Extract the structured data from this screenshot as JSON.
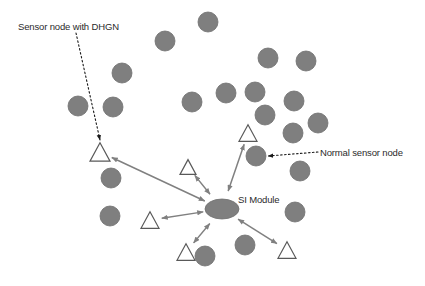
{
  "figure": {
    "width": 425,
    "height": 286,
    "background_color": "#ffffff",
    "node_fill_color": "#7f7f7f",
    "node_stroke_color": "#6e6e6e",
    "triangle_fill_color": "#ffffff",
    "triangle_stroke_color": "#595959",
    "connector_color": "#808080",
    "callout_color": "#1a1a1a",
    "text_color": "#2b2b2b"
  },
  "labels": {
    "sensor_with_dhgn": "Sensor node with DHGN",
    "normal_sensor_node": "Normal sensor node",
    "si_module": "SI Module"
  },
  "hub": {
    "name": "si-module",
    "shape": "ellipse",
    "cx": 222,
    "cy": 209,
    "rx": 17,
    "ry": 10
  },
  "sensor_nodes": [
    {
      "cx": 208,
      "cy": 22,
      "r": 10
    },
    {
      "cx": 165,
      "cy": 41,
      "r": 10
    },
    {
      "cx": 268,
      "cy": 58,
      "r": 10
    },
    {
      "cx": 306,
      "cy": 61,
      "r": 10
    },
    {
      "cx": 122,
      "cy": 73,
      "r": 10
    },
    {
      "cx": 255,
      "cy": 92,
      "r": 10
    },
    {
      "cx": 294,
      "cy": 101,
      "r": 10
    },
    {
      "cx": 192,
      "cy": 102,
      "r": 10
    },
    {
      "cx": 226,
      "cy": 93,
      "r": 10
    },
    {
      "cx": 78,
      "cy": 106,
      "r": 10
    },
    {
      "cx": 113,
      "cy": 107,
      "r": 10
    },
    {
      "cx": 265,
      "cy": 115,
      "r": 10
    },
    {
      "cx": 318,
      "cy": 123,
      "r": 10
    },
    {
      "cx": 293,
      "cy": 133,
      "r": 10
    },
    {
      "cx": 256,
      "cy": 156,
      "r": 10
    },
    {
      "cx": 300,
      "cy": 171,
      "r": 10
    },
    {
      "cx": 111,
      "cy": 178,
      "r": 10
    },
    {
      "cx": 110,
      "cy": 216,
      "r": 10
    },
    {
      "cx": 295,
      "cy": 212,
      "r": 10
    },
    {
      "cx": 245,
      "cy": 245,
      "r": 10
    },
    {
      "cx": 205,
      "cy": 256,
      "r": 10
    }
  ],
  "dhgn_nodes": [
    {
      "cx": 100,
      "cy": 152,
      "size": 20,
      "name": "dhgn-node-upper-left"
    },
    {
      "cx": 248,
      "cy": 133,
      "size": 18,
      "name": "dhgn-node-upper-right"
    },
    {
      "cx": 188,
      "cy": 167,
      "size": 16,
      "name": "dhgn-node-mid"
    },
    {
      "cx": 150,
      "cy": 220,
      "size": 18,
      "name": "dhgn-node-left"
    },
    {
      "cx": 186,
      "cy": 252,
      "size": 18,
      "name": "dhgn-node-lower-left"
    },
    {
      "cx": 287,
      "cy": 250,
      "size": 18,
      "name": "dhgn-node-lower-right"
    }
  ],
  "connections": [
    {
      "from": "si-module",
      "to": "dhgn-node-upper-left",
      "bidirectional": true
    },
    {
      "from": "si-module",
      "to": "dhgn-node-upper-right",
      "bidirectional": true
    },
    {
      "from": "si-module",
      "to": "dhgn-node-mid",
      "bidirectional": true
    },
    {
      "from": "si-module",
      "to": "dhgn-node-left",
      "bidirectional": true
    },
    {
      "from": "si-module",
      "to": "dhgn-node-lower-left",
      "bidirectional": true
    },
    {
      "from": "si-module",
      "to": "dhgn-node-lower-right",
      "bidirectional": true
    }
  ],
  "callouts": [
    {
      "name": "callout-sensor-dhgn",
      "x1": 76,
      "y1": 33,
      "x2": 100,
      "y2": 140,
      "style": "dotted"
    },
    {
      "name": "callout-normal-node",
      "x1": 318,
      "y1": 152,
      "x2": 268,
      "y2": 156,
      "style": "dotted"
    },
    {
      "name": "callout-normal-node-2",
      "x1": 299,
      "y1": 140,
      "x2": 290,
      "y2": 126,
      "style": "dotted"
    }
  ]
}
